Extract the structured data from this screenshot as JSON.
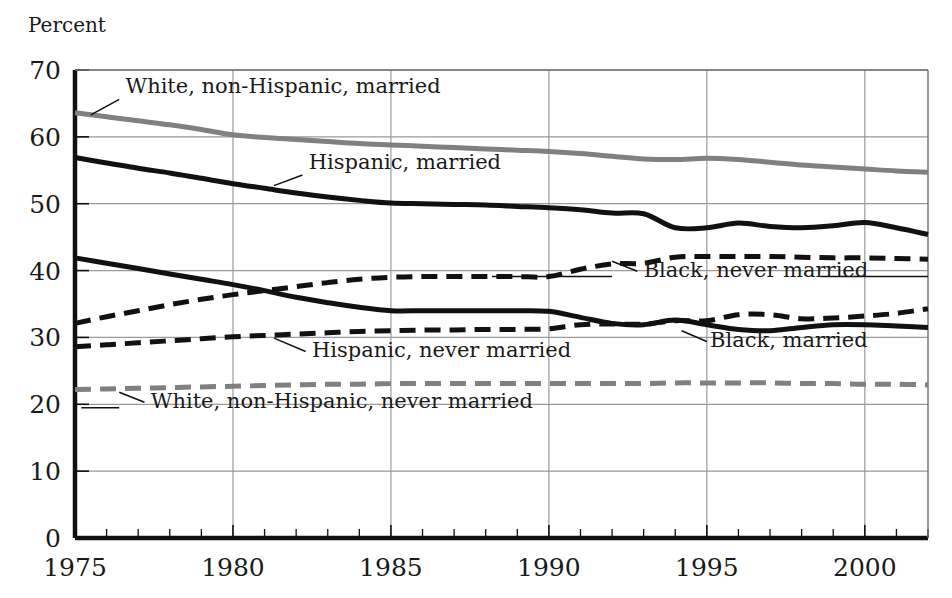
{
  "figure": {
    "y_axis_title": "Percent",
    "background_color": "#ffffff",
    "plot_border_color": "#111111",
    "gridline_color": "#9a9a9a"
  },
  "chart_data": {
    "type": "line",
    "title": "",
    "xlabel": "",
    "ylabel": "Percent",
    "xlim": [
      1975,
      2002
    ],
    "ylim": [
      0,
      70
    ],
    "ytick_values": [
      0,
      10,
      20,
      30,
      40,
      50,
      60,
      70
    ],
    "ytick_labels": [
      "0",
      "10",
      "20",
      "30",
      "40",
      "50",
      "60",
      "70"
    ],
    "xtick_values": [
      1975,
      1980,
      1985,
      1990,
      1995,
      2000
    ],
    "xtick_labels": [
      "1975",
      "1980",
      "1985",
      "1990",
      "1995",
      "2000"
    ],
    "minor_xticks": "every year from 1975 to 2002",
    "grid": "major horizontal and vertical gridlines",
    "legend_position": "inline annotations with leader lines",
    "x": [
      1975,
      1976,
      1977,
      1978,
      1979,
      1980,
      1981,
      1982,
      1983,
      1984,
      1985,
      1986,
      1987,
      1988,
      1989,
      1990,
      1991,
      1992,
      1993,
      1994,
      1995,
      1996,
      1997,
      1998,
      1999,
      2000,
      2001,
      2002
    ],
    "series": [
      {
        "name": "White, non-Hispanic, married",
        "color": "#808080",
        "style": "solid",
        "width": 5,
        "label_x": 1976.6,
        "label_y": 66.6,
        "label_anchor": "start",
        "leader": [
          [
            1975.5,
            63.3
          ],
          [
            1976.4,
            65.6
          ]
        ],
        "values": [
          63.6,
          63.0,
          62.4,
          61.8,
          61.1,
          60.3,
          59.9,
          59.6,
          59.3,
          59.0,
          58.8,
          58.6,
          58.4,
          58.2,
          58.0,
          57.8,
          57.5,
          57.1,
          56.7,
          56.6,
          56.8,
          56.6,
          56.2,
          55.8,
          55.5,
          55.2,
          54.9,
          54.7
        ]
      },
      {
        "name": "Hispanic, married",
        "color": "#111111",
        "style": "solid",
        "width": 5,
        "label_x": 1982.4,
        "label_y": 55.2,
        "label_anchor": "start",
        "leader": [
          [
            1981.3,
            52.7
          ],
          [
            1982.2,
            54.3
          ]
        ],
        "values": [
          56.9,
          56.1,
          55.3,
          54.6,
          53.8,
          53.0,
          52.3,
          51.6,
          51.0,
          50.5,
          50.1,
          50.0,
          49.9,
          49.8,
          49.6,
          49.4,
          49.1,
          48.6,
          48.5,
          46.4,
          46.4,
          47.1,
          46.6,
          46.4,
          46.7,
          47.2,
          46.4,
          45.4
        ]
      },
      {
        "name": "Black, never married",
        "color": "#111111",
        "style": "dashed",
        "width": 5,
        "label_x": 1993.0,
        "label_y": 39.1,
        "label_anchor": "start",
        "leader": [
          [
            1992.0,
            41.4
          ],
          [
            1992.8,
            39.9
          ]
        ],
        "rule_left": [
          [
            1988.2,
            39.1
          ],
          [
            1992.0,
            39.1
          ]
        ],
        "rule_right": [
          [
            1998.6,
            39.1
          ],
          [
            2002.0,
            39.1
          ]
        ],
        "values": [
          32.1,
          33.1,
          34.0,
          34.9,
          35.7,
          36.4,
          37.0,
          37.6,
          38.2,
          38.7,
          39.0,
          39.1,
          39.1,
          39.1,
          39.1,
          39.1,
          40.2,
          41.0,
          41.1,
          42.0,
          42.1,
          42.1,
          42.1,
          42.0,
          41.9,
          41.9,
          41.8,
          41.7
        ]
      },
      {
        "name": "Black, married",
        "color": "#111111",
        "style": "solid",
        "width": 5,
        "label_x": 1995.1,
        "label_y": 28.6,
        "label_anchor": "start",
        "leader": [
          [
            1994.2,
            31.0
          ],
          [
            1995.0,
            29.4
          ]
        ],
        "values": [
          41.9,
          41.1,
          40.3,
          39.5,
          38.7,
          37.9,
          37.0,
          36.0,
          35.2,
          34.5,
          34.0,
          34.0,
          34.0,
          34.0,
          34.0,
          33.9,
          33.0,
          32.1,
          31.9,
          32.6,
          31.9,
          31.2,
          31.0,
          31.5,
          31.9,
          31.9,
          31.7,
          31.5
        ]
      },
      {
        "name": "Hispanic, never married",
        "color": "#111111",
        "style": "dashed",
        "width": 5,
        "label_x": 1982.5,
        "label_y": 27.0,
        "label_anchor": "start",
        "leader": [
          [
            1981.3,
            29.9
          ],
          [
            1982.3,
            27.9
          ]
        ],
        "values": [
          28.6,
          28.9,
          29.2,
          29.5,
          29.8,
          30.1,
          30.3,
          30.5,
          30.7,
          30.9,
          31.0,
          31.1,
          31.1,
          31.2,
          31.2,
          31.3,
          31.9,
          32.0,
          32.0,
          32.5,
          32.5,
          33.4,
          33.4,
          32.8,
          32.9,
          33.2,
          33.6,
          34.3
        ]
      },
      {
        "name": "White, non-Hispanic, never married",
        "color": "#808080",
        "style": "dashed",
        "width": 5,
        "label_x": 1977.4,
        "label_y": 19.5,
        "label_anchor": "start",
        "leader": [
          [
            1976.4,
            21.8
          ],
          [
            1977.2,
            20.3
          ]
        ],
        "rule_left": [
          [
            1975.2,
            19.5
          ],
          [
            1976.4,
            19.5
          ]
        ],
        "values": [
          22.2,
          22.3,
          22.4,
          22.5,
          22.6,
          22.7,
          22.8,
          22.9,
          23.0,
          23.0,
          23.1,
          23.1,
          23.1,
          23.1,
          23.1,
          23.1,
          23.1,
          23.1,
          23.1,
          23.2,
          23.2,
          23.2,
          23.2,
          23.1,
          23.1,
          23.0,
          23.0,
          22.9
        ]
      }
    ]
  }
}
